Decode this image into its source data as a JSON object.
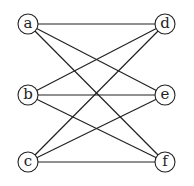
{
  "graph": {
    "nodes": [
      {
        "id": "a",
        "label": "a"
      },
      {
        "id": "b",
        "label": "b"
      },
      {
        "id": "c",
        "label": "c"
      },
      {
        "id": "d",
        "label": "d"
      },
      {
        "id": "e",
        "label": "e"
      },
      {
        "id": "f",
        "label": "f"
      }
    ],
    "edges": [
      [
        "a",
        "d"
      ],
      [
        "a",
        "e"
      ],
      [
        "a",
        "f"
      ],
      [
        "b",
        "d"
      ],
      [
        "b",
        "e"
      ],
      [
        "b",
        "f"
      ],
      [
        "c",
        "d"
      ],
      [
        "c",
        "e"
      ],
      [
        "c",
        "f"
      ]
    ]
  }
}
